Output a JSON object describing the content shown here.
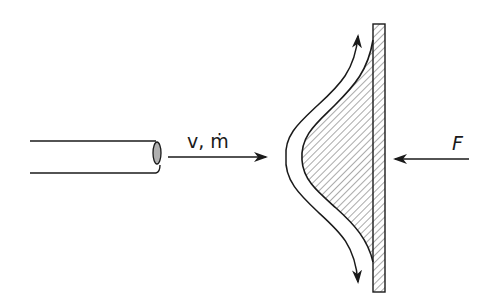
{
  "diagram": {
    "labels": {
      "velocity_mass_flow": "v, ṁ",
      "force": "F"
    },
    "components": [
      {
        "id": "pipe",
        "description": "nozzle pipe emitting jet"
      },
      {
        "id": "jet-arrow",
        "description": "jet flow direction arrow",
        "direction": "right"
      },
      {
        "id": "curved-deflector",
        "description": "hatched curved deflector attached to plate"
      },
      {
        "id": "flow-up-arrow",
        "description": "deflected flow upward"
      },
      {
        "id": "flow-down-arrow",
        "description": "deflected flow downward"
      },
      {
        "id": "plate",
        "description": "vertical flat plate, hatched"
      },
      {
        "id": "force-arrow",
        "description": "reaction force arrow",
        "direction": "left"
      }
    ],
    "colors": {
      "stroke": "#1a1a1a",
      "hatch": "#555555",
      "background": "#ffffff",
      "pipe_end_fill": "#b0b0b0"
    }
  }
}
